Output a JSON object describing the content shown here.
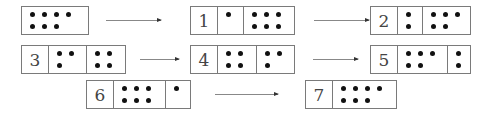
{
  "diagram": {
    "colors": {
      "border": "#7a7a7a",
      "dot": "#111111",
      "arrow": "#888888"
    },
    "boxes": [
      {
        "id": "start",
        "label": "",
        "x": 21,
        "y": 6,
        "w": 68,
        "h": 29,
        "cells": [
          {
            "type": "dots",
            "w": 66,
            "rows": [
              4,
              3
            ],
            "count": 7
          }
        ]
      },
      {
        "id": "1",
        "label": "1",
        "x": 190,
        "y": 6,
        "w": 105,
        "h": 29,
        "cells": [
          {
            "type": "label",
            "w": 26
          },
          {
            "type": "dots",
            "w": 26,
            "rows": [
              1,
              0
            ],
            "count": 1
          },
          {
            "type": "dots",
            "w": 51,
            "rows": [
              3,
              3
            ],
            "count": 6
          }
        ]
      },
      {
        "id": "2",
        "label": "2",
        "x": 370,
        "y": 6,
        "w": 101,
        "h": 29,
        "cells": [
          {
            "type": "label",
            "w": 26
          },
          {
            "type": "dots",
            "w": 25,
            "rows": [
              1,
              1
            ],
            "count": 2
          },
          {
            "type": "dots",
            "w": 48,
            "rows": [
              3,
              2
            ],
            "count": 5
          }
        ]
      },
      {
        "id": "3",
        "label": "3",
        "x": 21,
        "y": 45,
        "w": 105,
        "h": 29,
        "cells": [
          {
            "type": "label",
            "w": 26
          },
          {
            "type": "dots",
            "w": 38,
            "rows": [
              2,
              1
            ],
            "count": 3
          },
          {
            "type": "dots",
            "w": 39,
            "rows": [
              2,
              2
            ],
            "count": 4
          }
        ]
      },
      {
        "id": "4",
        "label": "4",
        "x": 190,
        "y": 45,
        "w": 105,
        "h": 29,
        "cells": [
          {
            "type": "label",
            "w": 26
          },
          {
            "type": "dots",
            "w": 39,
            "rows": [
              2,
              2
            ],
            "count": 4
          },
          {
            "type": "dots",
            "w": 38,
            "rows": [
              2,
              1
            ],
            "count": 3
          }
        ]
      },
      {
        "id": "5",
        "label": "5",
        "x": 370,
        "y": 45,
        "w": 101,
        "h": 29,
        "cells": [
          {
            "type": "label",
            "w": 26
          },
          {
            "type": "dots",
            "w": 50,
            "rows": [
              3,
              2
            ],
            "count": 5
          },
          {
            "type": "dots",
            "w": 23,
            "rows": [
              1,
              1
            ],
            "count": 2
          }
        ]
      },
      {
        "id": "6",
        "label": "6",
        "x": 86,
        "y": 80,
        "w": 105,
        "h": 29,
        "cells": [
          {
            "type": "label",
            "w": 26
          },
          {
            "type": "dots",
            "w": 52,
            "rows": [
              3,
              3
            ],
            "count": 6
          },
          {
            "type": "dots",
            "w": 25,
            "rows": [
              1,
              0
            ],
            "count": 1
          }
        ]
      },
      {
        "id": "7",
        "label": "7",
        "x": 305,
        "y": 80,
        "w": 92,
        "h": 29,
        "cells": [
          {
            "type": "label",
            "w": 26
          },
          {
            "type": "dots",
            "w": 64,
            "rows": [
              4,
              3
            ],
            "count": 7
          }
        ]
      }
    ],
    "arrows": [
      {
        "from": "start",
        "to": "1",
        "x": 106,
        "y": 20,
        "w": 55
      },
      {
        "from": "1",
        "to": "2",
        "x": 314,
        "y": 20,
        "w": 55
      },
      {
        "from": "3",
        "to": "4",
        "x": 140,
        "y": 59,
        "w": 39
      },
      {
        "from": "4",
        "to": "5",
        "x": 313,
        "y": 59,
        "w": 45
      },
      {
        "from": "6",
        "to": "7",
        "x": 215,
        "y": 94,
        "w": 63
      }
    ]
  }
}
